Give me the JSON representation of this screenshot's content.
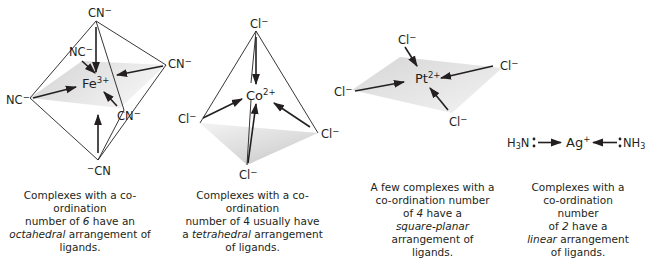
{
  "figure": {
    "panels": [
      {
        "id": "octahedral",
        "central_ion": {
          "symbol": "Fe",
          "charge": "3+"
        },
        "ligands": [
          "CN⁻",
          "NC⁻",
          "CN⁻",
          "NC⁻",
          "CN⁻",
          "⁻CN"
        ],
        "coordination_number": 6,
        "geometry": "octahedral",
        "caption": {
          "line1": "Complexes with a co-ordination",
          "line2_pre": "number of ",
          "line2_num": "6",
          "line2_post": " have an",
          "line3_geom": "octahedral",
          "line3_post": " arrangement of",
          "line4": "ligands."
        }
      },
      {
        "id": "tetrahedral",
        "central_ion": {
          "symbol": "Co",
          "charge": "2+"
        },
        "ligands": [
          "Cl⁻",
          "Cl⁻",
          "Cl⁻",
          "Cl⁻"
        ],
        "coordination_number": 4,
        "geometry": "tetrahedral",
        "caption": {
          "line1": "Complexes with a co-ordination",
          "line2": "number of 4 usually have",
          "line3_pre": "a ",
          "line3_geom": "tetrahedral",
          "line3_post": " arrangement",
          "line4": "of ligands."
        }
      },
      {
        "id": "square-planar",
        "central_ion": {
          "symbol": "Pt",
          "charge": "2+"
        },
        "ligands": [
          "Cl⁻",
          "Cl⁻",
          "Cl⁻",
          "Cl⁻"
        ],
        "coordination_number": 4,
        "geometry": "square-planar",
        "caption": {
          "line1": "A few complexes with a",
          "line2": "co-ordination number",
          "line3_pre": "of ",
          "line3_num": "4",
          "line3_post": " have a",
          "line4_geom": "square-planar",
          "line5": "arrangement of ligands."
        }
      },
      {
        "id": "linear",
        "central_ion": {
          "symbol": "Ag",
          "charge": "+"
        },
        "ligands": [
          "H₃N",
          "NH₃"
        ],
        "coordination_number": 2,
        "geometry": "linear",
        "caption": {
          "line1": "Complexes with a",
          "line2": "co-ordination number",
          "line3_pre": "of ",
          "line3_num": "2",
          "line3_post": " have a",
          "line4_geom": "linear",
          "line4_post": " arrangement",
          "line5": "of ligands."
        }
      }
    ]
  },
  "colors": {
    "line": "#231f20",
    "shade_dark": "#c8c8c8",
    "shade_light": "#f2f2f2"
  }
}
